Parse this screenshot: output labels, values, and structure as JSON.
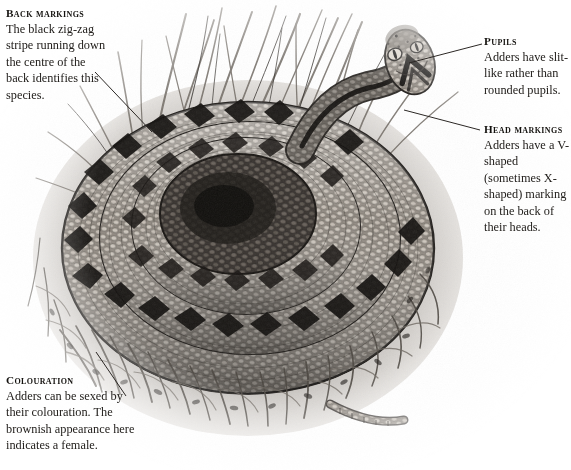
{
  "figure": {
    "palette": {
      "background": "#ffffff",
      "ink": "#1d1b19",
      "body_dark": "#2a2724",
      "body_mid": "#6d6762",
      "body_light": "#b9b2aa",
      "grass": "#8d877f",
      "leader_line": "#2b2724"
    }
  },
  "annotations": [
    {
      "id": "back-markings",
      "heading": "Back markings",
      "text": "The black zig-zag stripe running down the centre of the back identifies this species.",
      "leader": {
        "from_x": 95,
        "from_y": 72,
        "to_x": 152,
        "to_y": 132
      }
    },
    {
      "id": "pupils",
      "heading": "Pupils",
      "text": "Adders have slit-like rather than rounded pupils.",
      "leader": {
        "from_x": 482,
        "from_y": 44,
        "to_x": 409,
        "to_y": 63
      }
    },
    {
      "id": "head-markings",
      "heading": "Head markings",
      "text": "Adders have a V-shaped (sometimes X-shaped) marking on the back of their heads.",
      "leader": {
        "from_x": 480,
        "from_y": 130,
        "to_x": 404,
        "to_y": 110
      }
    },
    {
      "id": "colouration",
      "heading": "Colouration",
      "text": "Adders can be sexed by their colouration. The brownish appearance here indicates a female.",
      "leader": {
        "from_x": 126,
        "from_y": 396,
        "to_x": 96,
        "to_y": 352
      }
    }
  ]
}
